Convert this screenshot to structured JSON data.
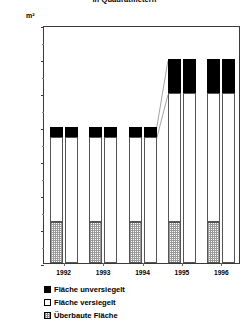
{
  "chart_data": {
    "type": "bar",
    "title": "in Quadratmetern",
    "ylabel": "m²",
    "xlabel": "",
    "ylim": [
      0,
      140000
    ],
    "ytick_step": 20000,
    "yticks": [
      0,
      20000,
      40000,
      60000,
      80000,
      100000,
      120000,
      140000
    ],
    "ytick_labels": [
      "0",
      "20000",
      "40000",
      "60000",
      "80000",
      "100000",
      "120000",
      "140000"
    ],
    "grid": false,
    "legend_position": "below",
    "stacked": true,
    "categories": [
      "1992",
      "1993",
      "1994",
      "1995",
      "1996"
    ],
    "series": [
      {
        "name": "Überbaute Fläche",
        "color": "#ffffff",
        "pattern": "hatch",
        "values": [
          24000,
          24000,
          24000,
          24000,
          24000
        ]
      },
      {
        "name": "Fläche versiegelt",
        "color": "#ffffff",
        "pattern": "solid",
        "values": [
          50000,
          50000,
          50000,
          76000,
          76000
        ]
      },
      {
        "name": "Fläche unversiegelt",
        "color": "#000000",
        "pattern": "solid",
        "values": [
          6000,
          6000,
          6000,
          20000,
          20000
        ]
      }
    ],
    "totals": [
      80000,
      80000,
      80000,
      120000,
      120000
    ],
    "annotations": [
      "Verbindungslinie 1994 Oberkante zu 1995 Oberkante",
      "Verbindungslinie 1994 Segmentgrenze zu 1995 Segmentgrenze"
    ]
  },
  "axis": {
    "unit": "m²",
    "ytick_labels": [
      "140000",
      "120000",
      "100000",
      "80000",
      "60000",
      "40000",
      "20000",
      "0"
    ],
    "xtick_labels": [
      "1992",
      "1993",
      "1994",
      "1995",
      "1996"
    ]
  },
  "legend": {
    "items": [
      {
        "label": "Fläche unversiegelt",
        "style": "black"
      },
      {
        "label": "Fläche versiegelt",
        "style": "white"
      },
      {
        "label": "Überbaute Fläche",
        "style": "hatch"
      }
    ]
  },
  "header": {
    "title": "in Quadratmetern"
  }
}
